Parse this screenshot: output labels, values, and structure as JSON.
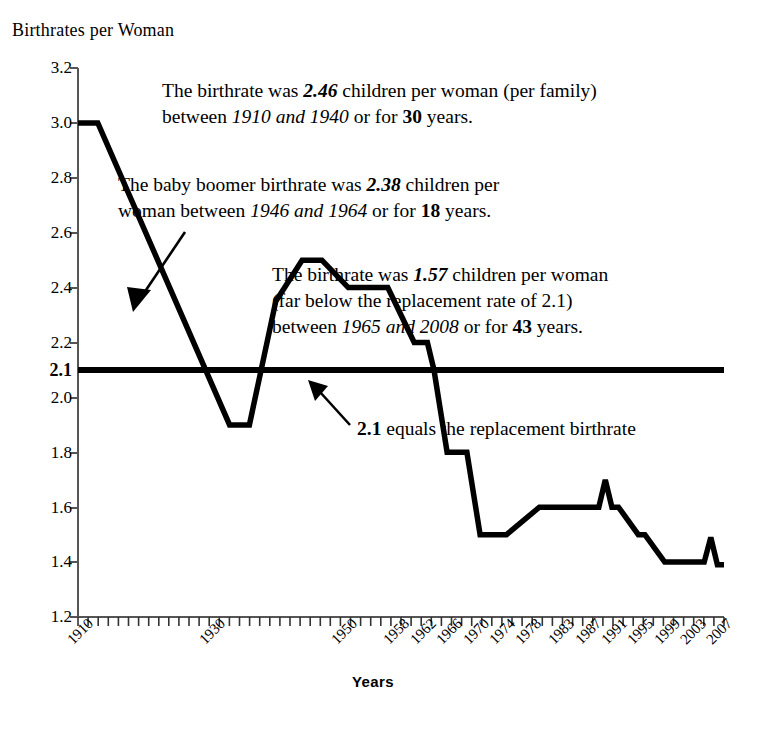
{
  "chart_data": {
    "type": "line",
    "title": "Birthrates per Woman",
    "xlabel": "Years",
    "ylabel": "Birthrates per Woman",
    "ylim": [
      1.2,
      3.2
    ],
    "xlim": [
      1910,
      2008
    ],
    "grid": false,
    "legend": "none",
    "ytick_labels": [
      "3.2",
      "3.0",
      "2.8",
      "2.6",
      "2.4",
      "2.2",
      "2.1",
      "2.0",
      "1.8",
      "1.6",
      "1.4",
      "1.2"
    ],
    "ytick_values": [
      3.2,
      3.0,
      2.8,
      2.6,
      2.4,
      2.2,
      2.1,
      2.0,
      1.8,
      1.6,
      1.4,
      1.2
    ],
    "ytick_bold": "2.1",
    "xtick_labels": [
      "1910",
      "1930",
      "1950",
      "1958",
      "1962",
      "1966",
      "1970",
      "1974",
      "1978",
      "1983",
      "1987",
      "1991",
      "1995",
      "1999",
      "2003",
      "2007"
    ],
    "xtick_values": [
      1910,
      1930,
      1950,
      1958,
      1962,
      1966,
      1970,
      1974,
      1978,
      1983,
      1987,
      1991,
      1995,
      1999,
      2003,
      2007
    ],
    "series": [
      {
        "name": "Birthrate per woman",
        "x": [
          1910,
          1913,
          1933,
          1936,
          1940,
          1944,
          1947,
          1951,
          1957,
          1961,
          1963,
          1964,
          1966,
          1967,
          1969,
          1971,
          1973,
          1975,
          1980,
          1981,
          1989,
          1990,
          1991,
          1992,
          1995,
          1996,
          1999,
          2000,
          2005,
          2006,
          2007,
          2008
        ],
        "values": [
          3.0,
          3.0,
          1.9,
          1.9,
          2.35,
          2.5,
          2.5,
          2.4,
          2.4,
          2.2,
          2.2,
          2.1,
          1.8,
          1.8,
          1.8,
          1.5,
          1.5,
          1.5,
          1.6,
          1.6,
          1.6,
          1.7,
          1.6,
          1.6,
          1.5,
          1.5,
          1.4,
          1.4,
          1.4,
          1.49,
          1.39,
          1.39
        ],
        "color": "#000000"
      },
      {
        "name": "Replacement rate",
        "x": [
          1910,
          2008
        ],
        "values": [
          2.1,
          2.1
        ],
        "color": "#000000"
      }
    ],
    "annotations": [
      {
        "id": "annot-birthrate-1910-1940",
        "line1_pre": "The birthrate was ",
        "line1_value": "2.46",
        "line1_post": " children per woman (per family)",
        "line2_pre": "between ",
        "line2_range": "1910 and 1940",
        "line2_mid": " or for ",
        "line2_years": "30",
        "line2_post": " years."
      },
      {
        "id": "annot-baby-boomer",
        "line1_pre": "The baby boomer birthrate was ",
        "line1_value": "2.38",
        "line1_post": " children per",
        "line2_pre": "woman between ",
        "line2_range": "1946 and 1964",
        "line2_mid": " or for ",
        "line2_years": "18",
        "line2_post": " years."
      },
      {
        "id": "annot-birthrate-1965-2008",
        "line1_pre": "The birthrate was ",
        "line1_value": "1.57",
        "line1_post": " children per woman",
        "line2": "(far below the replacement rate of 2.1)",
        "line3_pre": "between ",
        "line3_range": "1965 and 2008",
        "line3_mid": " or for ",
        "line3_years": "43",
        "line3_post": " years."
      }
    ],
    "replacement_label": {
      "value": "2.1",
      "text": " equals the replacement birthrate"
    }
  }
}
